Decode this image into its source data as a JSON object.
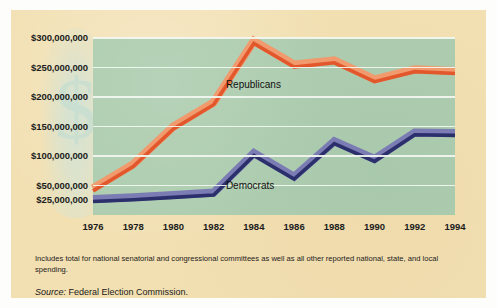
{
  "figure": {
    "panel_color": "#f2e0b2",
    "plot_color": "#aecdb0",
    "gridline_color": "#f3f7f1"
  },
  "notes": {
    "footnote": "Includes total for national senatorial and congressional committees as well as all other reported national, state, and local spending.",
    "source_label": "Source:",
    "source_value": "Federal Election Commission."
  },
  "chart_data": {
    "type": "line",
    "title": "",
    "subtitle": "",
    "xlabel": "",
    "ylabel": "",
    "grid": true,
    "legend_position": "inline-annotation",
    "x": [
      1976,
      1978,
      1980,
      1982,
      1984,
      1986,
      1988,
      1990,
      1992,
      1994
    ],
    "categories": [
      "1976",
      "1978",
      "1980",
      "1982",
      "1984",
      "1986",
      "1988",
      "1990",
      "1992",
      "1994"
    ],
    "ylim": [
      0,
      300000000
    ],
    "yticks": [
      25000000,
      50000000,
      100000000,
      150000000,
      200000000,
      250000000,
      300000000
    ],
    "ytick_labels": [
      "$25,000,000",
      "$50,000,000",
      "$100,000,000",
      "$150,000,000",
      "$200,000,000",
      "$250,000,000",
      "$300,000,000"
    ],
    "series": [
      {
        "name": "Republicans",
        "color": "#e2582c",
        "highlight_color": "#f09a6d",
        "values": [
          45000000,
          86000000,
          150000000,
          191000000,
          295000000,
          255000000,
          262000000,
          230000000,
          247000000,
          244000000
        ]
      },
      {
        "name": "Democrats",
        "color": "#2b2f6b",
        "highlight_color": "#7b7cb4",
        "values": [
          27000000,
          30000000,
          34000000,
          38000000,
          105000000,
          65000000,
          125000000,
          95000000,
          140000000,
          139000000
        ]
      }
    ],
    "annotations": [
      {
        "text": "Republicans",
        "x": 1984,
        "y": 218000000
      },
      {
        "text": "Democrats",
        "x": 1984,
        "y": 47000000
      }
    ]
  }
}
